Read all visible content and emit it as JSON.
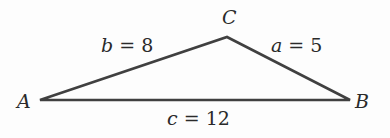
{
  "diagram": {
    "type": "triangle",
    "vertices": [
      {
        "id": "A",
        "label": "A",
        "x": 40,
        "y": 100
      },
      {
        "id": "B",
        "label": "B",
        "x": 350,
        "y": 100
      },
      {
        "id": "C",
        "label": "C",
        "x": 227,
        "y": 37
      }
    ],
    "sides": [
      {
        "name": "b",
        "value": "8",
        "between": [
          "A",
          "C"
        ]
      },
      {
        "name": "a",
        "value": "5",
        "between": [
          "C",
          "B"
        ]
      },
      {
        "name": "c",
        "value": "12",
        "between": [
          "A",
          "B"
        ]
      }
    ],
    "stroke_color": "#404040",
    "text_color": "#2a2a2a"
  }
}
